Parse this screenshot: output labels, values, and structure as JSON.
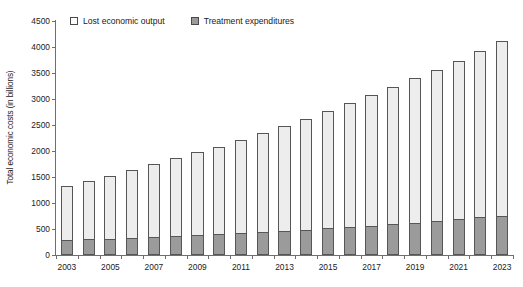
{
  "chart_data": {
    "type": "bar",
    "stacked": true,
    "title": "",
    "subtitle": "",
    "xlabel": "",
    "ylabel": "Total economic costs (in billions)",
    "ylim": [
      0,
      4500
    ],
    "yticks": [
      0,
      500,
      1000,
      1500,
      2000,
      2500,
      3000,
      3500,
      4000,
      4500
    ],
    "grid": false,
    "legend_position": "top-left",
    "categories": [
      "2003",
      "2004",
      "2005",
      "2006",
      "2007",
      "2008",
      "2009",
      "2010",
      "2011",
      "2012",
      "2013",
      "2014",
      "2015",
      "2016",
      "2017",
      "2018",
      "2019",
      "2020",
      "2021",
      "2022",
      "2023"
    ],
    "xtick_labels": [
      "2003",
      "",
      "2005",
      "",
      "2007",
      "",
      "2009",
      "",
      "2011",
      "",
      "2013",
      "",
      "2015",
      "",
      "2017",
      "",
      "2019",
      "",
      "2021",
      "",
      "2023"
    ],
    "series": [
      {
        "name": "Treatment expenditures",
        "color": "#9b9b9b",
        "values": [
          285,
          305,
          315,
          330,
          350,
          365,
          380,
          400,
          425,
          445,
          465,
          490,
          510,
          540,
          560,
          600,
          620,
          655,
          690,
          725,
          755
        ]
      },
      {
        "name": "Lost economic output",
        "color": "#ededed",
        "values": [
          1042,
          1120,
          1210,
          1310,
          1395,
          1500,
          1600,
          1680,
          1785,
          1895,
          2015,
          2120,
          2255,
          2380,
          2510,
          2625,
          2775,
          2905,
          3045,
          3200,
          3365
        ]
      }
    ],
    "totals": [
      1327,
      1425,
      1525,
      1640,
      1745,
      1865,
      1980,
      2080,
      2210,
      2340,
      2480,
      2610,
      2765,
      2920,
      3070,
      3225,
      3395,
      3560,
      3735,
      3925,
      4120
    ]
  },
  "legend": {
    "items": [
      {
        "label": "Lost economic output",
        "swatch": "lost"
      },
      {
        "label": "Treatment expenditures",
        "swatch": "treat"
      }
    ]
  }
}
